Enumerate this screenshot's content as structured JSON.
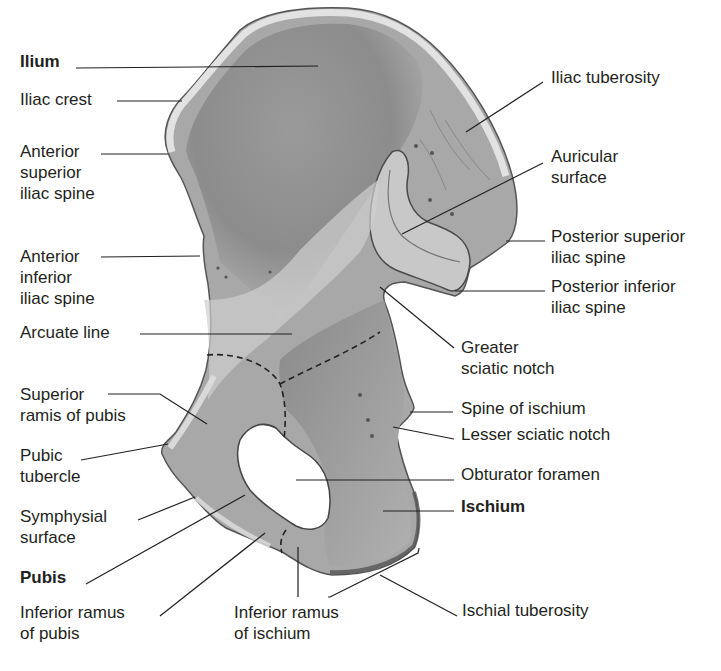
{
  "figure": {
    "labels": [
      {
        "id": "ilium",
        "text": "Ilium",
        "bold": true,
        "x": 20,
        "y": 51,
        "pointer": [
          [
            76,
            68
          ],
          [
            318,
            66
          ]
        ]
      },
      {
        "id": "iliac-crest",
        "text": "Iliac crest",
        "x": 20,
        "y": 89,
        "pointer": [
          [
            117,
            101
          ],
          [
            182,
            101
          ]
        ]
      },
      {
        "id": "asis",
        "text": "Anterior\nsuperior\niliac spine",
        "x": 20,
        "y": 141,
        "pointer": [
          [
            101,
            154
          ],
          [
            168,
            154
          ]
        ]
      },
      {
        "id": "aiis",
        "text": "Anterior\ninferior\niliac spine",
        "x": 20,
        "y": 246,
        "pointer": [
          [
            101,
            257
          ],
          [
            200,
            256
          ]
        ]
      },
      {
        "id": "arcuate-line",
        "text": "Arcuate line",
        "x": 20,
        "y": 322,
        "pointer": [
          [
            140,
            334
          ],
          [
            292,
            334
          ]
        ]
      },
      {
        "id": "superior-ramus-pubis",
        "text": "Superior\nramis of pubis",
        "x": 20,
        "y": 384,
        "pointer": [
          [
            108,
            394
          ],
          [
            160,
            394
          ],
          [
            207,
            424
          ]
        ]
      },
      {
        "id": "pubic-tubercle",
        "text": "Pubic\ntubercle",
        "x": 20,
        "y": 445,
        "pointer": [
          [
            81,
            460
          ],
          [
            168,
            444
          ]
        ]
      },
      {
        "id": "symphysial-surface",
        "text": "Symphysial\nsurface",
        "x": 20,
        "y": 506,
        "pointer": [
          [
            138,
            520
          ],
          [
            195,
            497
          ]
        ]
      },
      {
        "id": "pubis",
        "text": "Pubis",
        "bold": true,
        "x": 20,
        "y": 567,
        "pointer": [
          [
            86,
            584
          ],
          [
            245,
            495
          ]
        ]
      },
      {
        "id": "inferior-ramus-pubis",
        "text": "Inferior ramus\nof pubis",
        "x": 20,
        "y": 602,
        "pointer": [
          [
            160,
            616
          ],
          [
            265,
            533
          ]
        ]
      },
      {
        "id": "inferior-ramus-ischium",
        "text": "Inferior ramus\nof ischium",
        "x": 234,
        "y": 602,
        "pointer": [
          [
            298,
            597
          ],
          [
            298,
            547
          ]
        ]
      },
      {
        "id": "ischial-tuberosity",
        "text": "Ischial tuberosity",
        "x": 462,
        "y": 600,
        "pointer": [
          [
            457,
            616
          ],
          [
            380,
            575
          ]
        ],
        "bracket": [
          [
            328,
            597
          ],
          [
            330,
            597
          ],
          [
            418,
            553
          ],
          [
            419,
            548
          ]
        ]
      },
      {
        "id": "iliac-tuberosity",
        "text": "Iliac tuberosity",
        "x": 551,
        "y": 67,
        "pointer": [
          [
            543,
            82
          ],
          [
            466,
            132
          ]
        ]
      },
      {
        "id": "auricular-surface",
        "text": "Auricular\nsurface",
        "x": 551,
        "y": 146,
        "pointer": [
          [
            543,
            163
          ],
          [
            402,
            234
          ]
        ]
      },
      {
        "id": "psis",
        "text": "Posterior superior\niliac spine",
        "x": 551,
        "y": 226,
        "pointer": [
          [
            545,
            241
          ],
          [
            506,
            241
          ]
        ]
      },
      {
        "id": "piis",
        "text": "Posterior inferior\niliac spine",
        "x": 551,
        "y": 276,
        "pointer": [
          [
            545,
            291
          ],
          [
            455,
            291
          ]
        ]
      },
      {
        "id": "greater-sciatic-notch",
        "text": "Greater\nsciatic notch",
        "x": 461,
        "y": 337,
        "pointer": [
          [
            454,
            348
          ],
          [
            380,
            287
          ]
        ]
      },
      {
        "id": "spine-ischium",
        "text": "Spine of ischium",
        "x": 461,
        "y": 398,
        "pointer": [
          [
            453,
            412
          ],
          [
            410,
            412
          ]
        ]
      },
      {
        "id": "lesser-sciatic-notch",
        "text": "Lesser sciatic notch",
        "x": 461,
        "y": 424,
        "pointer": [
          [
            454,
            439
          ],
          [
            393,
            427
          ]
        ]
      },
      {
        "id": "obturator-foramen",
        "text": "Obturator foramen",
        "x": 461,
        "y": 464,
        "pointer": [
          [
            454,
            480
          ],
          [
            296,
            480
          ]
        ]
      },
      {
        "id": "ischium",
        "text": "Ischium",
        "bold": true,
        "x": 461,
        "y": 496,
        "pointer": [
          [
            454,
            511
          ],
          [
            383,
            511
          ]
        ]
      }
    ]
  }
}
